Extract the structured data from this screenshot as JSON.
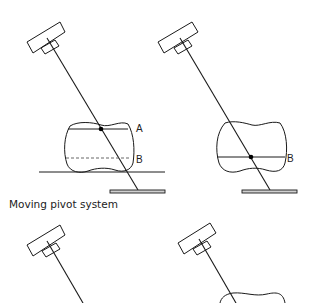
{
  "caption": "Moving pivot system",
  "panels": {
    "top_left": {
      "labels": {
        "upper_line": "A",
        "lower_line": "B"
      }
    },
    "top_right": {
      "labels": {
        "line": "B"
      }
    },
    "bottom_left": {},
    "bottom_right": {}
  },
  "colors": {
    "stroke": "#1a1a1a",
    "plate_fill": "#d0d0d0",
    "background": "#ffffff"
  }
}
